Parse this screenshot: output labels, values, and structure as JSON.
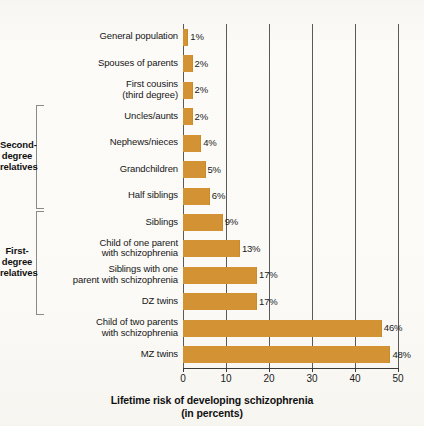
{
  "chart_data": {
    "type": "bar",
    "orientation": "horizontal",
    "title": "",
    "xlabel": "Lifetime risk of developing schizophrenia\n(in percents)",
    "ylabel": "",
    "xlim": [
      0,
      50
    ],
    "grid": true,
    "legend": null,
    "unit": "%",
    "xticks": [
      0,
      10,
      20,
      30,
      40,
      50
    ],
    "xtick_labels": [
      "0",
      "10",
      "20",
      "30",
      "40",
      "50"
    ],
    "bar_color": "#d39233",
    "categories": [
      "General population",
      "Spouses of parents",
      "First cousins\n(third degree)",
      "Uncles/aunts",
      "Nephews/nieces",
      "Grandchildren",
      "Half siblings",
      "Siblings",
      "Child of one parent\nwith schizophrenia",
      "Siblings with one\nparent with schizophrenia",
      "DZ twins",
      "Child of two parents\nwith schizophrenia",
      "MZ twins"
    ],
    "values": [
      1,
      2,
      2,
      2,
      4,
      5,
      6,
      9,
      13,
      17,
      17,
      46,
      48
    ],
    "value_labels": [
      "1%",
      "2%",
      "2%",
      "2%",
      "4%",
      "5%",
      "6%",
      "9%",
      "13%",
      "17%",
      "17%",
      "46%",
      "48%"
    ],
    "groups": [
      {
        "label": "Second-\ndegree\nrelatives",
        "from_category": "Uncles/aunts",
        "to_category": "Half siblings"
      },
      {
        "label": "First-\ndegree\nrelatives",
        "from_category": "Siblings",
        "to_category": "DZ twins"
      }
    ]
  }
}
